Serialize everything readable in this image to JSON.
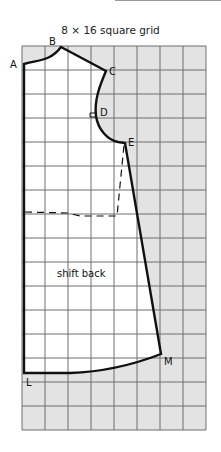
{
  "diagram": {
    "title": "8 × 16 square grid",
    "grid": {
      "columns": 8,
      "rows": 16,
      "shade_color": "#e3e3e3",
      "line_color": "#6e6e6e",
      "pattern_fill": "#ffffff"
    },
    "pattern_label": "shift back",
    "points": [
      {
        "id": "A",
        "label": "A"
      },
      {
        "id": "B",
        "label": "B"
      },
      {
        "id": "C",
        "label": "C"
      },
      {
        "id": "D",
        "label": "D"
      },
      {
        "id": "E",
        "label": "E"
      },
      {
        "id": "L",
        "label": "L"
      },
      {
        "id": "M",
        "label": "M"
      }
    ],
    "outline_color": "#111111"
  }
}
